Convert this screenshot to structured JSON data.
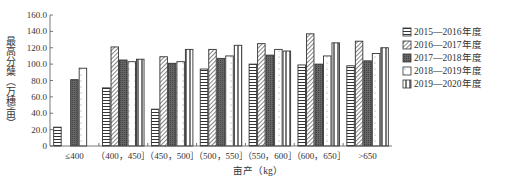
{
  "chart_data": {
    "type": "bar",
    "title": "",
    "xlabel": "亩产（kg）",
    "ylabel": "最高分蘖（万穗/亩）",
    "ylim": [
      0,
      160
    ],
    "yticks": [
      "0",
      "20.0",
      "40.0",
      "60.0",
      "80.0",
      "100.0",
      "120.0",
      "140.0",
      "160.0"
    ],
    "grid": false,
    "legend_position": "right",
    "categories": [
      "≤400",
      "（400，450］",
      "（450，500］",
      "（500，550］",
      "（550，600］",
      "（600，650］",
      ">650"
    ],
    "series": [
      {
        "name": "2015—2016年度",
        "pattern": "horizontal-lines",
        "values": [
          23,
          71,
          45,
          94,
          100,
          99,
          98
        ]
      },
      {
        "name": "2016—2017年度",
        "pattern": "diagonal-lines",
        "values": [
          0,
          121,
          109,
          118,
          125,
          137,
          128
        ]
      },
      {
        "name": "2017—2018年度",
        "pattern": "dark-dotted",
        "values": [
          81,
          105,
          101,
          107,
          111,
          100,
          104
        ]
      },
      {
        "name": "2018—2019年度",
        "pattern": "light-dotted",
        "values": [
          95,
          103,
          103,
          110,
          118,
          110,
          113
        ]
      },
      {
        "name": "2019—2020年度",
        "pattern": "vertical-lines",
        "values": [
          0,
          106,
          118,
          123,
          116,
          126,
          120
        ]
      }
    ]
  },
  "legend": {
    "items": [
      "2015—2016年度",
      "2016—2017年度",
      "2017—2018年度",
      "2018—2019年度",
      "2019—2020年度"
    ]
  },
  "axes": {
    "xlabel": "亩产（kg）",
    "ylabel": "最高分蘖（万穗/亩）"
  }
}
